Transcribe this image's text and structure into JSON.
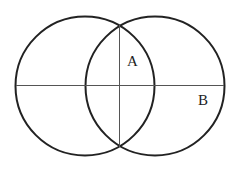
{
  "diagram": {
    "type": "two-overlapping-circles",
    "circles": [
      {
        "name": "left-circle",
        "cx": 85,
        "cy": 86,
        "r": 70
      },
      {
        "name": "right-circle",
        "cx": 155,
        "cy": 86,
        "r": 70
      }
    ],
    "lines": [
      {
        "name": "horizontal-line",
        "x1": 16,
        "y1": 85,
        "x2": 224,
        "y2": 85
      },
      {
        "name": "vertical-line",
        "x1": 120,
        "y1": 24,
        "x2": 120,
        "y2": 147
      }
    ],
    "labels": {
      "a": "A",
      "b": "B"
    },
    "colors": {
      "stroke": "#222222",
      "line": "#555555",
      "background": "#ffffff"
    }
  }
}
